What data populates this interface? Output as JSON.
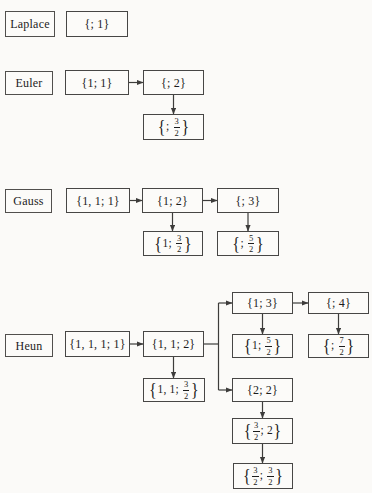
{
  "figure": {
    "canvas": {
      "width": 372,
      "height": 493,
      "background": "#fbfaf8",
      "line_color": "#3d3c3b",
      "text_color": "#1c1c1c"
    },
    "rows": [
      "Laplace",
      "Euler",
      "Gauss",
      "Heun"
    ],
    "nodes": [
      {
        "id": "laplace",
        "kind": "label",
        "x": 5,
        "y": 11,
        "w": 50,
        "h": 26,
        "tokens": [
          {
            "t": "Laplace"
          }
        ]
      },
      {
        "id": "laplace-0-1",
        "x": 66,
        "y": 11,
        "w": 62,
        "h": 26,
        "tokens": [
          {
            "t": "{; 1}"
          }
        ]
      },
      {
        "id": "euler",
        "kind": "label",
        "x": 5,
        "y": 71,
        "w": 48,
        "h": 24,
        "tokens": [
          {
            "t": "Euler"
          }
        ]
      },
      {
        "id": "euler-1-1",
        "x": 65,
        "y": 70,
        "w": 64,
        "h": 25,
        "tokens": [
          {
            "t": "{1; 1}"
          }
        ]
      },
      {
        "id": "euler-0-2",
        "x": 143,
        "y": 70,
        "w": 61,
        "h": 25,
        "tokens": [
          {
            "t": "{; 2}"
          }
        ]
      },
      {
        "id": "euler-0-3h",
        "x": 143,
        "y": 114,
        "w": 61,
        "h": 26,
        "tokens": [
          {
            "b": "{"
          },
          {
            "t": "; "
          },
          {
            "n": "3",
            "d": "2"
          },
          {
            "b": "}"
          }
        ]
      },
      {
        "id": "gauss",
        "kind": "label",
        "x": 5,
        "y": 189,
        "w": 47,
        "h": 24,
        "tokens": [
          {
            "t": "Gauss"
          }
        ]
      },
      {
        "id": "gauss-11-1",
        "x": 66,
        "y": 188,
        "w": 64,
        "h": 25,
        "tokens": [
          {
            "t": "{1, 1; 1}"
          }
        ]
      },
      {
        "id": "gauss-1-2",
        "x": 142,
        "y": 188,
        "w": 61,
        "h": 25,
        "tokens": [
          {
            "t": "{1; 2}"
          }
        ]
      },
      {
        "id": "gauss-0-3",
        "x": 217,
        "y": 188,
        "w": 62,
        "h": 25,
        "tokens": [
          {
            "t": "{; 3}"
          }
        ]
      },
      {
        "id": "gauss-1-3h",
        "x": 143,
        "y": 231,
        "w": 60,
        "h": 25,
        "tokens": [
          {
            "b": "{"
          },
          {
            "t": "1; "
          },
          {
            "n": "3",
            "d": "2"
          },
          {
            "b": "}"
          }
        ]
      },
      {
        "id": "gauss-0-5h",
        "x": 217,
        "y": 231,
        "w": 62,
        "h": 25,
        "tokens": [
          {
            "b": "{"
          },
          {
            "t": "; "
          },
          {
            "n": "5",
            "d": "2"
          },
          {
            "b": "}"
          }
        ]
      },
      {
        "id": "heun-1-3",
        "x": 232,
        "y": 292,
        "w": 61,
        "h": 22,
        "tokens": [
          {
            "t": "{1; 3}"
          }
        ]
      },
      {
        "id": "heun-0-4",
        "x": 308,
        "y": 292,
        "w": 61,
        "h": 22,
        "tokens": [
          {
            "t": "{; 4}"
          }
        ]
      },
      {
        "id": "heun",
        "kind": "label",
        "x": 5,
        "y": 334,
        "w": 48,
        "h": 23,
        "tokens": [
          {
            "t": "Heun"
          }
        ]
      },
      {
        "id": "heun-111-1",
        "x": 65,
        "y": 331,
        "w": 65,
        "h": 26,
        "tokens": [
          {
            "t": "{1, 1, 1; 1}"
          }
        ]
      },
      {
        "id": "heun-11-2",
        "x": 143,
        "y": 331,
        "w": 61,
        "h": 26,
        "tokens": [
          {
            "t": "{1, 1; 2}"
          }
        ]
      },
      {
        "id": "heun-1-5h",
        "x": 232,
        "y": 334,
        "w": 61,
        "h": 24,
        "tokens": [
          {
            "b": "{"
          },
          {
            "t": "1; "
          },
          {
            "n": "5",
            "d": "2"
          },
          {
            "b": "}"
          }
        ]
      },
      {
        "id": "heun-0-7h",
        "x": 308,
        "y": 334,
        "w": 61,
        "h": 24,
        "tokens": [
          {
            "b": "{"
          },
          {
            "t": "; "
          },
          {
            "n": "7",
            "d": "2"
          },
          {
            "b": "}"
          }
        ]
      },
      {
        "id": "heun-11-3h",
        "x": 143,
        "y": 378,
        "w": 62,
        "h": 24,
        "tokens": [
          {
            "b": "{"
          },
          {
            "t": "1, 1; "
          },
          {
            "n": "3",
            "d": "2"
          },
          {
            "b": "}"
          }
        ]
      },
      {
        "id": "heun-2-2",
        "x": 232,
        "y": 378,
        "w": 61,
        "h": 24,
        "tokens": [
          {
            "t": "{2; 2}"
          }
        ]
      },
      {
        "id": "heun-3h-2",
        "x": 232,
        "y": 418,
        "w": 61,
        "h": 26,
        "tokens": [
          {
            "b": "{"
          },
          {
            "n": "3",
            "d": "2"
          },
          {
            "t": "; 2"
          },
          {
            "b": "}"
          }
        ]
      },
      {
        "id": "heun-3h-3h",
        "x": 233,
        "y": 463,
        "w": 60,
        "h": 26,
        "tokens": [
          {
            "b": "{"
          },
          {
            "n": "3",
            "d": "2"
          },
          {
            "t": "; "
          },
          {
            "n": "3",
            "d": "2"
          },
          {
            "b": "}"
          }
        ]
      }
    ],
    "edges": [
      {
        "x1": 129,
        "y1": 82.5,
        "x2": 143,
        "y2": 82.5,
        "arrow": true
      },
      {
        "x1": 173.5,
        "y1": 95,
        "x2": 173.5,
        "y2": 114,
        "arrow": true
      },
      {
        "x1": 130,
        "y1": 200.5,
        "x2": 142,
        "y2": 200.5,
        "arrow": true
      },
      {
        "x1": 203,
        "y1": 200.5,
        "x2": 217,
        "y2": 200.5,
        "arrow": true
      },
      {
        "x1": 172.5,
        "y1": 213,
        "x2": 172.5,
        "y2": 231,
        "arrow": true
      },
      {
        "x1": 248,
        "y1": 213,
        "x2": 248,
        "y2": 231,
        "arrow": true
      },
      {
        "x1": 130,
        "y1": 344,
        "x2": 143,
        "y2": 344,
        "arrow": true
      },
      {
        "x1": 204,
        "y1": 344,
        "x2": 218.5,
        "y2": 344,
        "arrow": false
      },
      {
        "x1": 218.5,
        "y1": 303,
        "x2": 218.5,
        "y2": 390,
        "arrow": false
      },
      {
        "x1": 218.5,
        "y1": 303,
        "x2": 232,
        "y2": 303,
        "arrow": true
      },
      {
        "x1": 218.5,
        "y1": 390,
        "x2": 232,
        "y2": 390,
        "arrow": true
      },
      {
        "x1": 293,
        "y1": 303,
        "x2": 308,
        "y2": 303,
        "arrow": true
      },
      {
        "x1": 262.5,
        "y1": 314,
        "x2": 262.5,
        "y2": 334,
        "arrow": true
      },
      {
        "x1": 338.5,
        "y1": 314,
        "x2": 338.5,
        "y2": 334,
        "arrow": true
      },
      {
        "x1": 173.5,
        "y1": 357,
        "x2": 173.5,
        "y2": 378,
        "arrow": true
      },
      {
        "x1": 262.5,
        "y1": 402,
        "x2": 262.5,
        "y2": 418,
        "arrow": true
      },
      {
        "x1": 262.5,
        "y1": 444,
        "x2": 262.5,
        "y2": 463,
        "arrow": true
      }
    ]
  }
}
